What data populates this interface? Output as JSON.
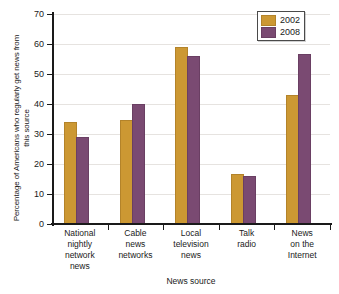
{
  "chart_data": {
    "type": "bar",
    "title": "",
    "xlabel": "News source",
    "ylabel": "Percentage of Americans who regularly get news from this source",
    "categories": [
      "National nightly network news",
      "Cable news networks",
      "Local television news",
      "Talk radio",
      "News on the Internet"
    ],
    "category_lines": [
      [
        "National",
        "nightly",
        "network",
        "news"
      ],
      [
        "Cable",
        "news",
        "networks"
      ],
      [
        "Local",
        "television",
        "news"
      ],
      [
        "Talk",
        "radio"
      ],
      [
        "News",
        "on the",
        "Internet"
      ]
    ],
    "series": [
      {
        "name": "2002",
        "color": "#cc9833",
        "values": [
          33.5,
          34,
          58.5,
          16,
          42.5
        ]
      },
      {
        "name": "2008",
        "color": "#7a4a72",
        "values": [
          28.5,
          39.5,
          55.5,
          15.5,
          56
        ]
      }
    ],
    "ylim": [
      0,
      70
    ],
    "yticks": [
      0,
      10,
      20,
      30,
      40,
      50,
      60,
      70
    ],
    "ytick_labels": [
      "0",
      "10",
      "20",
      "30",
      "40",
      "50",
      "60",
      "70"
    ],
    "grid": true,
    "legend_position": "top-right"
  },
  "legend": {
    "entries": [
      {
        "label": "2002"
      },
      {
        "label": "2008"
      }
    ]
  }
}
